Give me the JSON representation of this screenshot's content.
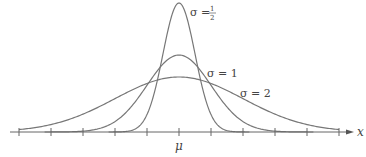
{
  "chart_data": {
    "type": "line",
    "title": "",
    "xlabel": "x",
    "ylabel": "",
    "center_label": "μ",
    "x_ticks_units": [
      -5,
      -4,
      -3,
      -2,
      -1,
      0,
      1,
      2,
      3,
      4,
      5
    ],
    "series": [
      {
        "name": "σ = 1/2",
        "sigma": 0.5,
        "label_sym": "σ =",
        "label_num": "1",
        "label_den": "2",
        "peak_px": 129
      },
      {
        "name": "σ = 1",
        "sigma": 1,
        "label_sym": "σ = 1",
        "peak_px": 77
      },
      {
        "name": "σ = 2",
        "sigma": 2,
        "label_sym": "σ = 2",
        "peak_px": 55
      }
    ],
    "grid": false,
    "legend": "inline labels",
    "colors": {
      "curve": "#777777",
      "axis": "#555555",
      "text": "#444444"
    }
  }
}
